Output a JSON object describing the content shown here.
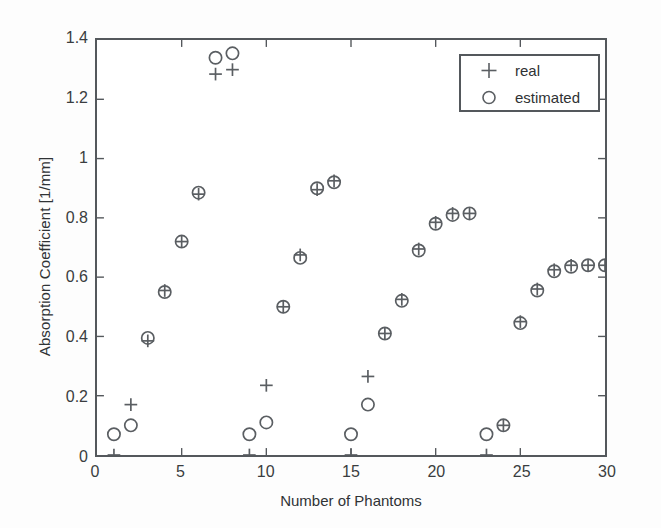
{
  "chart_data": {
    "type": "scatter",
    "title": "",
    "xlabel": "Number of Phantoms",
    "ylabel": "Absorption Coefficient [1/mm]",
    "xlim": [
      0,
      30
    ],
    "ylim": [
      0,
      1.4
    ],
    "xticks": [
      0,
      5,
      10,
      15,
      20,
      25,
      30
    ],
    "xtick_labels": [
      "0",
      "5",
      "10",
      "15",
      "20",
      "25",
      "30"
    ],
    "yticks": [
      0,
      0.2,
      0.4,
      0.6,
      0.8,
      1,
      1.2,
      1.4
    ],
    "ytick_labels": [
      "0",
      "0.2",
      "0.4",
      "0.6",
      "0.8",
      "1",
      "1.2",
      "1.4"
    ],
    "grid": false,
    "legend_position": "top-right",
    "marker_color": "#5a5e62",
    "axis_color": "#54585c",
    "x": [
      1,
      2,
      3,
      4,
      5,
      6,
      7,
      8,
      9,
      10,
      11,
      12,
      13,
      14,
      15,
      16,
      17,
      18,
      19,
      20,
      21,
      22,
      23,
      24,
      25,
      26,
      27,
      28,
      29,
      30
    ],
    "series": [
      {
        "name": "real",
        "marker": "+",
        "values": [
          0,
          0.17,
          0.385,
          0.555,
          0.72,
          0.88,
          1.285,
          1.3,
          0,
          0.235,
          0.5,
          0.675,
          0.895,
          0.925,
          0,
          0.265,
          0.41,
          0.525,
          0.695,
          0.785,
          0.815,
          0.815,
          0,
          0.1,
          0.45,
          0.56,
          0.625,
          0.64,
          0.64,
          0.64
        ]
      },
      {
        "name": "estimated",
        "marker": "o",
        "values": [
          0.07,
          0.1,
          0.395,
          0.55,
          0.72,
          0.885,
          1.34,
          1.355,
          0.07,
          0.11,
          0.5,
          0.665,
          0.9,
          0.92,
          0.07,
          0.17,
          0.41,
          0.52,
          0.69,
          0.78,
          0.81,
          0.815,
          0.07,
          0.1,
          0.445,
          0.555,
          0.62,
          0.635,
          0.64,
          0.64
        ]
      }
    ]
  },
  "legend": {
    "entries": [
      {
        "marker": "plus-marker",
        "label": "real"
      },
      {
        "marker": "circle-marker",
        "label": "estimated"
      }
    ]
  }
}
